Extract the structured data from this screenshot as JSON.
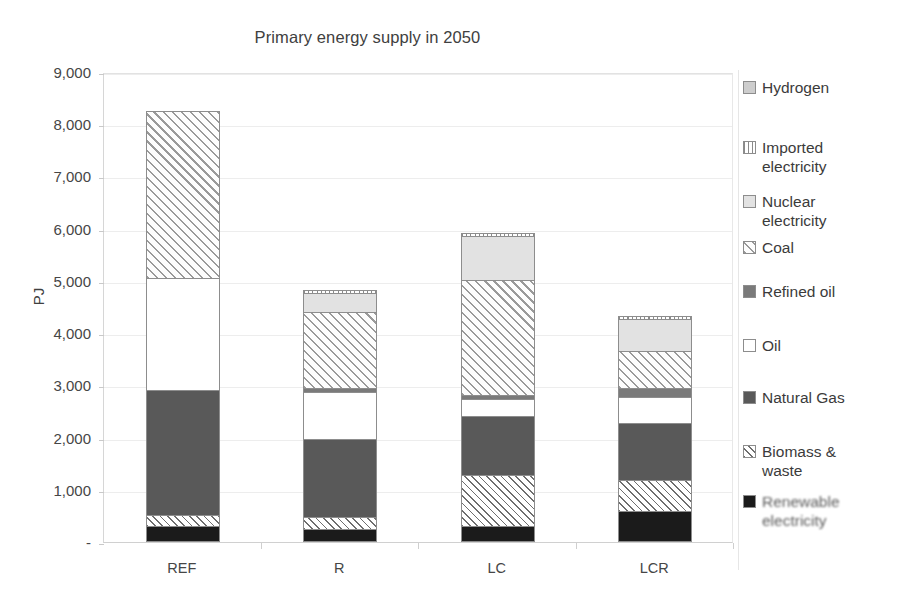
{
  "chart_data": {
    "type": "bar",
    "subtype": "stacked-bar",
    "title": "Primary energy supply in 2050",
    "xlabel": "",
    "ylabel": "PJ",
    "categories": [
      "REF",
      "R",
      "LC",
      "LCR"
    ],
    "ylim": [
      0,
      9000
    ],
    "ytick_values": [
      0,
      1000,
      2000,
      3000,
      4000,
      5000,
      6000,
      7000,
      8000,
      9000
    ],
    "ytick_labels": [
      "-",
      "1,000",
      "2,000",
      "3,000",
      "4,000",
      "5,000",
      "6,000",
      "7,000",
      "8,000",
      "9,000"
    ],
    "grid": true,
    "legend_position": "right",
    "series": [
      {
        "name": "Renewable electricity",
        "values": [
          310,
          240,
          300,
          590
        ]
      },
      {
        "name": "Biomass & waste",
        "values": [
          210,
          230,
          990,
          600
        ]
      },
      {
        "name": "Natural Gas",
        "values": [
          2390,
          1510,
          1130,
          1090
        ]
      },
      {
        "name": "Oil",
        "values": [
          2140,
          900,
          310,
          490
        ]
      },
      {
        "name": "Refined oil",
        "values": [
          0,
          60,
          90,
          170
        ]
      },
      {
        "name": "Coal",
        "values": [
          3200,
          1470,
          2200,
          710
        ]
      },
      {
        "name": "Nuclear electricity",
        "values": [
          0,
          350,
          840,
          620
        ]
      },
      {
        "name": "Imported electricity",
        "values": [
          0,
          60,
          60,
          60
        ]
      },
      {
        "name": "Hydrogen",
        "values": [
          0,
          0,
          0,
          0
        ]
      }
    ],
    "totals": [
      8250,
      4820,
      5920,
      4330
    ]
  },
  "legend": {
    "items": [
      {
        "label": "Hydrogen",
        "swatch": "hydrogen-swatch",
        "fill": "f-hydrogen",
        "blurred": false
      },
      {
        "label": "Imported\nelectricity",
        "swatch": "imported-electricity-swatch",
        "fill": "f-imported",
        "blurred": false
      },
      {
        "label": "Nuclear\nelectricity",
        "swatch": "nuclear-electricity-swatch",
        "fill": "f-nuclear",
        "blurred": false
      },
      {
        "label": "Coal",
        "swatch": "coal-swatch",
        "fill": "f-coal",
        "blurred": false
      },
      {
        "label": "Refined oil",
        "swatch": "refined-oil-swatch",
        "fill": "f-refinedoil",
        "blurred": false
      },
      {
        "label": "Oil",
        "swatch": "oil-swatch",
        "fill": "f-oil",
        "blurred": false
      },
      {
        "label": "Natural Gas",
        "swatch": "natural-gas-swatch",
        "fill": "f-natgas",
        "blurred": false
      },
      {
        "label": "Biomass &\nwaste",
        "swatch": "biomass-waste-swatch",
        "fill": "f-biomass",
        "blurred": false
      },
      {
        "label": "Renewable\nelectricity",
        "swatch": "renewable-electricity-swatch",
        "fill": "f-renewable",
        "blurred": true
      }
    ]
  },
  "colors": {
    "renewable_electricity": "#1b1b1b",
    "natural_gas": "#595959",
    "refined_oil": "#7a7a7a",
    "nuclear_electricity": "#e2e2e2",
    "hydrogen": "#cdcdcd",
    "oil": "#ffffff",
    "gridline": "#ededed",
    "text": "#404040"
  }
}
